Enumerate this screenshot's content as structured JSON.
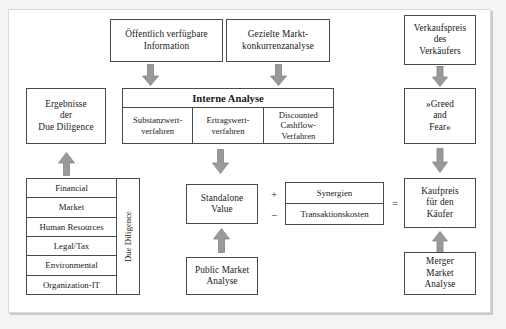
{
  "diagram": {
    "colors": {
      "box_border": "#4a4a4a",
      "arrow_fill": "#9a9a9a",
      "arrow_stroke": "#808080",
      "page_background": "#f4f4f2",
      "canvas_background": "#ffffff",
      "text": "#1a1a1a"
    },
    "nodes": {
      "oeffentlich_information": {
        "label": "Öffentlich verfügbare Information",
        "lines": [
          "Öffentlich verfügbare",
          "Information"
        ]
      },
      "gezielte_marktanalyse": {
        "label": "Gezielte Marktkonkurrenzanalyse",
        "lines": [
          "Gezielte Markt-",
          "konkurrenzanalyse"
        ]
      },
      "verkaufspreis": {
        "label": "Verkaufspreis des Verkäufers",
        "lines": [
          "Verkaufspreis",
          "des",
          "Verkäufers"
        ]
      },
      "ergebnisse_due_diligence": {
        "label": "Ergebnisse der Due Diligence",
        "lines": [
          "Ergebnisse",
          "der",
          "Due Diligence"
        ]
      },
      "greed_and_fear": {
        "label": "»Greed and Fear«",
        "lines": [
          "»Greed",
          "and",
          "Fear«"
        ]
      },
      "standalone_value": {
        "label": "Standalone Value",
        "lines": [
          "Standalone",
          "Value"
        ]
      },
      "public_market_analyse": {
        "label": "Public Market Analyse",
        "lines": [
          "Public Market",
          "Analyse"
        ]
      },
      "kaufpreis": {
        "label": "Kaufpreis für den Käufer",
        "lines": [
          "Kaufpreis",
          "für den",
          "Käufer"
        ]
      },
      "merger_market_analyse": {
        "label": "Merger Market Analyse",
        "lines": [
          "Merger",
          "Market",
          "Analyse"
        ]
      }
    },
    "interne_analyse": {
      "title": "Interne Analyse",
      "columns": [
        {
          "lines": [
            "Substanzwert-",
            "verfahren"
          ],
          "label": "Substanzwertverfahren"
        },
        {
          "lines": [
            "Ertragswert-",
            "verfahren"
          ],
          "label": "Ertragswertverfahren"
        },
        {
          "lines": [
            "Discounted",
            "Cashflow-",
            "Verfahren"
          ],
          "label": "Discounted Cashflow-Verfahren"
        }
      ]
    },
    "due_diligence": {
      "side_label": "Due Diligence",
      "rows": [
        "Financial",
        "Market",
        "Human Resources",
        "Legal/Tax",
        "Environmental",
        "Organization-IT"
      ]
    },
    "synergies": {
      "rows": [
        {
          "operator": "+",
          "label": "Synergien"
        },
        {
          "operator": "−",
          "label": "Transaktionskosten"
        }
      ],
      "equals": "="
    },
    "arrows": [
      {
        "name": "oeffentlich-to-interne",
        "direction": "down"
      },
      {
        "name": "gezielte-to-interne",
        "direction": "down"
      },
      {
        "name": "verkaufspreis-to-greed",
        "direction": "down"
      },
      {
        "name": "greed-to-kaufpreis",
        "direction": "down"
      },
      {
        "name": "interne-to-standalone",
        "direction": "down"
      },
      {
        "name": "duediligence-to-ergebnisse",
        "direction": "up"
      },
      {
        "name": "publicmarket-to-standalone",
        "direction": "up"
      },
      {
        "name": "mergermarket-to-kaufpreis",
        "direction": "up"
      }
    ]
  }
}
